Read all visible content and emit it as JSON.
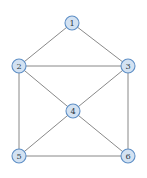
{
  "figure": {
    "title": "",
    "background_color": "#ffffff",
    "width": 147,
    "height": 178
  },
  "graph": {
    "type": "undirected-graph",
    "node_radius": 7,
    "node_fill_color": "#d3e2f2",
    "node_stroke_color": "#5e8fc6",
    "edge_color": "#7c7c7c",
    "label_color": "#2d3a46",
    "nodes": [
      {
        "id": "1",
        "label": "1",
        "x": 72,
        "y": 23
      },
      {
        "id": "2",
        "label": "2",
        "x": 19,
        "y": 66
      },
      {
        "id": "3",
        "label": "3",
        "x": 128,
        "y": 66
      },
      {
        "id": "4",
        "label": "4",
        "x": 73,
        "y": 111
      },
      {
        "id": "5",
        "label": "5",
        "x": 19,
        "y": 156
      },
      {
        "id": "6",
        "label": "6",
        "x": 128,
        "y": 156
      }
    ],
    "edges": [
      {
        "source": "1",
        "target": "2",
        "x1": 72,
        "y1": 23,
        "x2": 19,
        "y2": 66
      },
      {
        "source": "1",
        "target": "3",
        "x1": 72,
        "y1": 23,
        "x2": 128,
        "y2": 66
      },
      {
        "source": "2",
        "target": "3",
        "x1": 19,
        "y1": 66,
        "x2": 128,
        "y2": 66
      },
      {
        "source": "2",
        "target": "4",
        "x1": 19,
        "y1": 66,
        "x2": 73,
        "y2": 111
      },
      {
        "source": "2",
        "target": "5",
        "x1": 19,
        "y1": 66,
        "x2": 19,
        "y2": 156
      },
      {
        "source": "3",
        "target": "4",
        "x1": 128,
        "y1": 66,
        "x2": 73,
        "y2": 111
      },
      {
        "source": "3",
        "target": "6",
        "x1": 128,
        "y1": 66,
        "x2": 128,
        "y2": 156
      },
      {
        "source": "4",
        "target": "5",
        "x1": 73,
        "y1": 111,
        "x2": 19,
        "y2": 156
      },
      {
        "source": "4",
        "target": "6",
        "x1": 73,
        "y1": 111,
        "x2": 128,
        "y2": 156
      },
      {
        "source": "5",
        "target": "6",
        "x1": 19,
        "y1": 156,
        "x2": 128,
        "y2": 156
      }
    ]
  }
}
